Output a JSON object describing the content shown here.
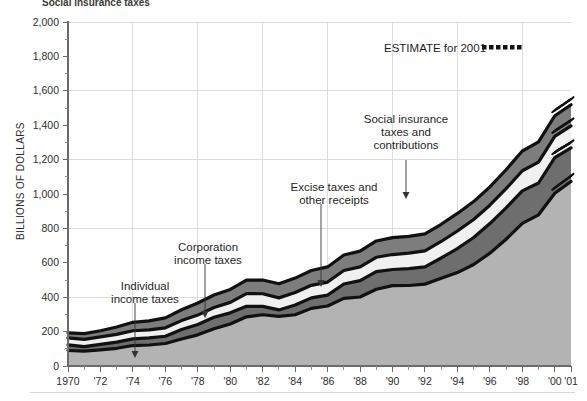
{
  "meta": {
    "cut_off_title": "Social insurance taxes",
    "legend_label": "ESTIMATE for 2001",
    "legend_marker": "dotted-line-marker"
  },
  "chart_data": {
    "type": "area",
    "stacked": true,
    "title": "",
    "xlabel": "",
    "ylabel": "BILLIONS OF DOLLARS",
    "ylim": [
      0,
      2000
    ],
    "xlim": [
      1970,
      2001
    ],
    "grid": true,
    "legend_position": "inside-top-right",
    "ytick_labels": [
      "0",
      "200",
      "400",
      "600",
      "800",
      "1,000",
      "1,200",
      "1,400",
      "1,600",
      "1,800",
      "2,000"
    ],
    "ytick_values": [
      0,
      200,
      400,
      600,
      800,
      1000,
      1200,
      1400,
      1600,
      1800,
      2000
    ],
    "xtick_labels": [
      "1970",
      "'72",
      "'74",
      "'76",
      "'78",
      "'80",
      "'82",
      "'84",
      "'86",
      "'88",
      "'90",
      "'92",
      "'94",
      "'96",
      "'98",
      "'00",
      "'01"
    ],
    "xtick_values": [
      1970,
      1972,
      1974,
      1976,
      1978,
      1980,
      1982,
      1984,
      1986,
      1988,
      1990,
      1992,
      1994,
      1996,
      1998,
      2000,
      2001
    ],
    "x": [
      1970,
      1971,
      1972,
      1973,
      1974,
      1975,
      1976,
      1977,
      1978,
      1979,
      1980,
      1981,
      1982,
      1983,
      1984,
      1985,
      1986,
      1987,
      1988,
      1989,
      1990,
      1991,
      1992,
      1993,
      1994,
      1995,
      1996,
      1997,
      1998,
      1999,
      2000,
      2001
    ],
    "series": [
      {
        "name": "Individual income taxes",
        "color": "#b3b3b3",
        "values": [
          90,
          86,
          94,
          103,
          119,
          122,
          131,
          157,
          181,
          217,
          244,
          286,
          298,
          289,
          298,
          335,
          349,
          393,
          401,
          446,
          467,
          468,
          476,
          510,
          543,
          590,
          656,
          737,
          829,
          879,
          1004,
          1073
        ]
      },
      {
        "name": "Corporation income taxes",
        "color": "#6e6e6e",
        "values": [
          33,
          27,
          32,
          36,
          39,
          41,
          42,
          55,
          60,
          66,
          65,
          61,
          49,
          37,
          57,
          61,
          63,
          84,
          95,
          103,
          94,
          98,
          100,
          118,
          140,
          157,
          172,
          182,
          189,
          185,
          207,
          195
        ]
      },
      {
        "name": "Excise taxes and other receipts",
        "color": "#f0f0f0",
        "values": [
          40,
          42,
          43,
          45,
          47,
          47,
          49,
          52,
          55,
          57,
          61,
          74,
          73,
          70,
          72,
          73,
          76,
          78,
          80,
          83,
          87,
          90,
          93,
          96,
          102,
          105,
          107,
          112,
          117,
          121,
          124,
          128
        ]
      },
      {
        "name": "Social insurance taxes and contributions",
        "color": "#7d7d7d",
        "values": [
          30,
          33,
          36,
          43,
          49,
          52,
          58,
          63,
          70,
          73,
          75,
          78,
          80,
          82,
          84,
          86,
          88,
          90,
          92,
          95,
          98,
          98,
          99,
          100,
          102,
          104,
          106,
          110,
          115,
          118,
          120,
          123
        ]
      }
    ],
    "annotations": [
      {
        "text": "Individual income taxes",
        "lines": [
          "Individual",
          "income taxes"
        ],
        "target_year": 1974
      },
      {
        "text": "Corporation income taxes",
        "lines": [
          "Corporation",
          "income taxes"
        ],
        "target_year": 1978
      },
      {
        "text": "Excise taxes and other receipts",
        "lines": [
          "Excise taxes and",
          "other receipts"
        ],
        "target_year": 1986
      },
      {
        "text": "Social insurance taxes and contributions",
        "lines": [
          "Social insurance",
          "taxes and",
          "contributions"
        ],
        "target_year": 1991
      }
    ]
  }
}
